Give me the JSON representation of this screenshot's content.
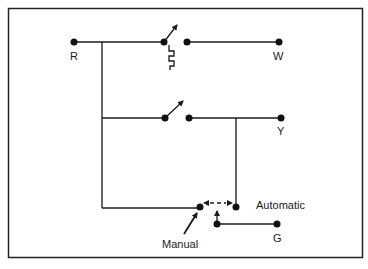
{
  "diagram": {
    "colors": {
      "background": "#ffffff",
      "ink": "#1a1a1a",
      "frame": "#222222"
    },
    "terminals": [
      {
        "id": "R",
        "label": "R"
      },
      {
        "id": "W",
        "label": "W"
      },
      {
        "id": "Y",
        "label": "Y"
      },
      {
        "id": "G",
        "label": "G"
      }
    ],
    "fan_switch": {
      "manual_label": "Manual",
      "automatic_label": "Automatic"
    },
    "components": [
      "heat-switch-with-heat-anticipator-resistor",
      "cool-switch",
      "fan-selector-switch"
    ]
  }
}
